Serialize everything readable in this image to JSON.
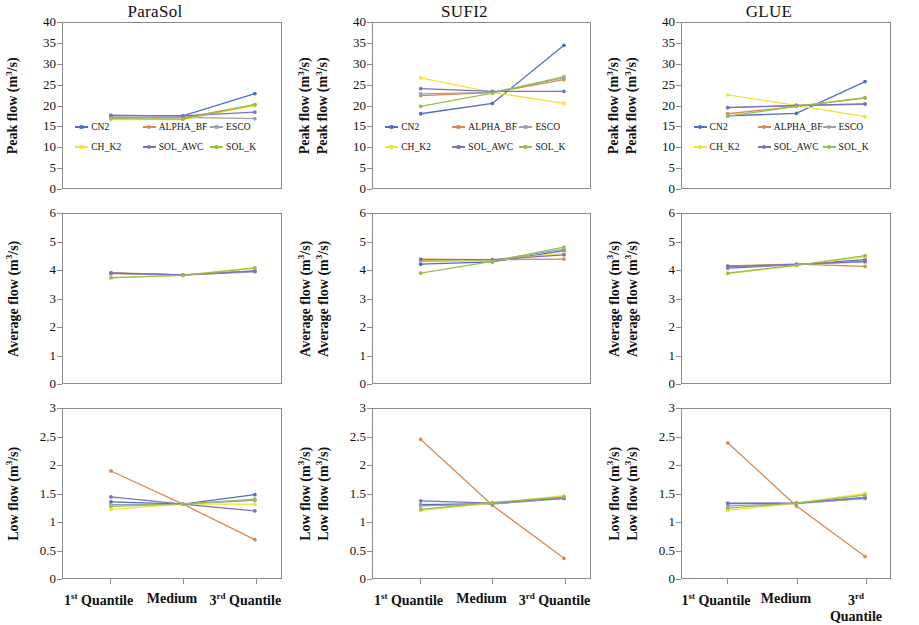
{
  "figure": {
    "columns": [
      "ParaSol",
      "SUFI2",
      "GLUE"
    ],
    "rows": [
      "Peak flow",
      "Average flow",
      "Low flow"
    ],
    "x_categories": [
      "1st Quantile",
      "Medium",
      "3rd Quantile"
    ],
    "x_categories_rich": [
      {
        "num": "1",
        "sup": "st",
        "word": "Quantile"
      },
      {
        "num": "",
        "sup": "",
        "word": "Medium"
      },
      {
        "num": "3",
        "sup": "rd",
        "word": "Quantile"
      }
    ],
    "axis_unit": "m³/s",
    "series_names": [
      "CN2",
      "ALPHA_BF",
      "ESCO",
      "CH_K2",
      "SOL_AWC",
      "SOL_K"
    ],
    "series_colors": {
      "CN2": "#4f6fc4",
      "ALPHA_BF": "#d98a4e",
      "ESCO": "#9aa3ad",
      "CH_K2": "#f2e23c",
      "SOL_AWC": "#7f6fc0",
      "SOL_K": "#96c04b"
    }
  },
  "legend": {
    "entries": [
      {
        "label": "CN2",
        "color": "#4f6fc4"
      },
      {
        "label": "ALPHA_BF",
        "color": "#d98a4e"
      },
      {
        "label": "ESCO",
        "color": "#9aa3ad"
      },
      {
        "label": "CH_K2",
        "color": "#f2e23c"
      },
      {
        "label": "SOL_AWC",
        "color": "#7f6fc0"
      },
      {
        "label": "SOL_K",
        "color": "#96c04b"
      }
    ]
  },
  "chart_data": [
    {
      "type": "line",
      "title": "ParaSol",
      "row": "Peak flow",
      "ylabel": "Peak flow (m³/s)",
      "xlabel": "",
      "categories": [
        "1st Quantile",
        "Medium",
        "3rd Quantile"
      ],
      "ylim": [
        0,
        40
      ],
      "yticks": [
        0,
        5,
        10,
        15,
        20,
        25,
        30,
        35,
        40
      ],
      "grid": false,
      "legend_position": "inside-lower-left",
      "series": [
        {
          "name": "CN2",
          "values": [
            17.6,
            17.5,
            22.9
          ]
        },
        {
          "name": "ALPHA_BF",
          "values": [
            17.1,
            17.0,
            20.2
          ]
        },
        {
          "name": "ESCO",
          "values": [
            17.2,
            17.1,
            16.8
          ]
        },
        {
          "name": "CH_K2",
          "values": [
            16.6,
            16.6,
            20.0
          ]
        },
        {
          "name": "SOL_AWC",
          "values": [
            17.6,
            17.5,
            18.4
          ]
        },
        {
          "name": "SOL_K",
          "values": [
            16.8,
            16.7,
            20.2
          ]
        }
      ]
    },
    {
      "type": "line",
      "title": "SUFI2",
      "row": "Peak flow",
      "ylabel": "Peak flow (m³/s)",
      "xlabel": "",
      "categories": [
        "1st Quantile",
        "Medium",
        "3rd Quantile"
      ],
      "ylim": [
        0,
        40
      ],
      "yticks": [
        0,
        5,
        10,
        15,
        20,
        25,
        30,
        35,
        40
      ],
      "grid": false,
      "legend_position": "inside-lower-left",
      "series": [
        {
          "name": "CN2",
          "values": [
            18.0,
            20.5,
            34.6
          ]
        },
        {
          "name": "ALPHA_BF",
          "values": [
            22.4,
            23.1,
            26.3
          ]
        },
        {
          "name": "ESCO",
          "values": [
            22.8,
            23.2,
            26.7
          ]
        },
        {
          "name": "CH_K2",
          "values": [
            26.7,
            23.2,
            20.5
          ]
        },
        {
          "name": "SOL_AWC",
          "values": [
            24.1,
            23.4,
            23.4
          ]
        },
        {
          "name": "SOL_K",
          "values": [
            19.8,
            23.0,
            27.0
          ]
        }
      ]
    },
    {
      "type": "line",
      "title": "GLUE",
      "row": "Peak flow",
      "ylabel": "Peak flow (m³/s)",
      "xlabel": "",
      "categories": [
        "1st Quantile",
        "Medium",
        "3rd Quantile"
      ],
      "ylim": [
        0,
        40
      ],
      "yticks": [
        0,
        5,
        10,
        15,
        20,
        25,
        30,
        35,
        40
      ],
      "grid": false,
      "legend_position": "inside-lower-left",
      "series": [
        {
          "name": "CN2",
          "values": [
            17.5,
            18.1,
            25.8
          ]
        },
        {
          "name": "ALPHA_BF",
          "values": [
            18.0,
            19.8,
            21.9
          ]
        },
        {
          "name": "ESCO",
          "values": [
            19.5,
            20.0,
            20.3
          ]
        },
        {
          "name": "CH_K2",
          "values": [
            22.6,
            20.0,
            17.3
          ]
        },
        {
          "name": "SOL_AWC",
          "values": [
            19.5,
            20.0,
            20.4
          ]
        },
        {
          "name": "SOL_K",
          "values": [
            17.4,
            19.8,
            21.8
          ]
        }
      ]
    },
    {
      "type": "line",
      "title": "ParaSol",
      "row": "Average flow",
      "ylabel": "Average flow (m³/s)",
      "xlabel": "",
      "categories": [
        "1st Quantile",
        "Medium",
        "3rd Quantile"
      ],
      "ylim": [
        0,
        6
      ],
      "yticks": [
        0,
        1,
        2,
        3,
        4,
        5,
        6
      ],
      "grid": false,
      "legend_position": "none",
      "series": [
        {
          "name": "CN2",
          "values": [
            3.9,
            3.84,
            3.98
          ]
        },
        {
          "name": "ALPHA_BF",
          "values": [
            3.92,
            3.84,
            3.96
          ]
        },
        {
          "name": "ESCO",
          "values": [
            3.88,
            3.83,
            3.95
          ]
        },
        {
          "name": "CH_K2",
          "values": [
            3.73,
            3.83,
            4.1
          ]
        },
        {
          "name": "SOL_AWC",
          "values": [
            3.9,
            3.84,
            3.97
          ]
        },
        {
          "name": "SOL_K",
          "values": [
            3.74,
            3.82,
            4.08
          ]
        }
      ]
    },
    {
      "type": "line",
      "title": "SUFI2",
      "row": "Average flow",
      "ylabel": "Average flow (m³/s)",
      "xlabel": "",
      "categories": [
        "1st Quantile",
        "Medium",
        "3rd Quantile"
      ],
      "ylim": [
        0,
        6
      ],
      "yticks": [
        0,
        1,
        2,
        3,
        4,
        5,
        6
      ],
      "grid": false,
      "legend_position": "none",
      "series": [
        {
          "name": "CN2",
          "values": [
            4.22,
            4.3,
            4.7
          ]
        },
        {
          "name": "ALPHA_BF",
          "values": [
            4.4,
            4.38,
            4.4
          ]
        },
        {
          "name": "ESCO",
          "values": [
            4.32,
            4.35,
            4.75
          ]
        },
        {
          "name": "CH_K2",
          "values": [
            4.35,
            4.36,
            4.6
          ]
        },
        {
          "name": "SOL_AWC",
          "values": [
            4.38,
            4.38,
            4.55
          ]
        },
        {
          "name": "SOL_K",
          "values": [
            3.9,
            4.32,
            4.82
          ]
        }
      ]
    },
    {
      "type": "line",
      "title": "GLUE",
      "row": "Average flow",
      "ylabel": "Average flow (m³/s)",
      "xlabel": "",
      "categories": [
        "1st Quantile",
        "Medium",
        "3rd Quantile"
      ],
      "ylim": [
        0,
        6
      ],
      "yticks": [
        0,
        1,
        2,
        3,
        4,
        5,
        6
      ],
      "grid": false,
      "legend_position": "none",
      "series": [
        {
          "name": "CN2",
          "values": [
            4.08,
            4.2,
            4.38
          ]
        },
        {
          "name": "ALPHA_BF",
          "values": [
            4.16,
            4.22,
            4.14
          ]
        },
        {
          "name": "ESCO",
          "values": [
            4.12,
            4.2,
            4.3
          ]
        },
        {
          "name": "CH_K2",
          "values": [
            3.88,
            4.18,
            4.48
          ]
        },
        {
          "name": "SOL_AWC",
          "values": [
            4.14,
            4.21,
            4.32
          ]
        },
        {
          "name": "SOL_K",
          "values": [
            3.9,
            4.18,
            4.52
          ]
        }
      ]
    },
    {
      "type": "line",
      "title": "ParaSol",
      "row": "Low flow",
      "ylabel": "Low flow (m³/s)",
      "xlabel": "",
      "categories": [
        "1st Quantile",
        "Medium",
        "3rd Quantile"
      ],
      "ylim": [
        0,
        3
      ],
      "yticks": [
        0,
        0.5,
        1,
        1.5,
        2,
        2.5,
        3
      ],
      "ytick_labels": [
        "0",
        "0.5",
        "1",
        "1.5",
        "2",
        "2.5",
        "3"
      ],
      "grid": false,
      "legend_position": "none",
      "series": [
        {
          "name": "CN2",
          "values": [
            1.35,
            1.31,
            1.48
          ]
        },
        {
          "name": "ALPHA_BF",
          "values": [
            1.9,
            1.31,
            0.68
          ]
        },
        {
          "name": "ESCO",
          "values": [
            1.3,
            1.31,
            1.38
          ]
        },
        {
          "name": "CH_K2",
          "values": [
            1.22,
            1.31,
            1.31
          ]
        },
        {
          "name": "SOL_AWC",
          "values": [
            1.44,
            1.31,
            1.19
          ]
        },
        {
          "name": "SOL_K",
          "values": [
            1.27,
            1.31,
            1.4
          ]
        }
      ]
    },
    {
      "type": "line",
      "title": "SUFI2",
      "row": "Low flow",
      "ylabel": "Low flow (m³/s)",
      "xlabel": "",
      "categories": [
        "1st Quantile",
        "Medium",
        "3rd Quantile"
      ],
      "ylim": [
        0,
        3
      ],
      "yticks": [
        0,
        0.5,
        1,
        1.5,
        2,
        2.5,
        3
      ],
      "ytick_labels": [
        "0",
        "0.5",
        "1",
        "1.5",
        "2",
        "2.5",
        "3"
      ],
      "grid": false,
      "legend_position": "none",
      "series": [
        {
          "name": "CN2",
          "values": [
            1.3,
            1.32,
            1.42
          ]
        },
        {
          "name": "ALPHA_BF",
          "values": [
            2.46,
            1.29,
            0.35
          ]
        },
        {
          "name": "ESCO",
          "values": [
            1.28,
            1.31,
            1.41
          ]
        },
        {
          "name": "CH_K2",
          "values": [
            1.2,
            1.33,
            1.46
          ]
        },
        {
          "name": "SOL_AWC",
          "values": [
            1.37,
            1.33,
            1.42
          ]
        },
        {
          "name": "SOL_K",
          "values": [
            1.22,
            1.34,
            1.44
          ]
        }
      ]
    },
    {
      "type": "line",
      "title": "GLUE",
      "row": "Low flow",
      "ylabel": "Low flow (m³/s)",
      "xlabel": "",
      "categories": [
        "1st Quantile",
        "Medium",
        "3rd Quantile"
      ],
      "ylim": [
        0,
        3
      ],
      "yticks": [
        0,
        0.5,
        1,
        1.5,
        2,
        2.5,
        3
      ],
      "ytick_labels": [
        "0",
        "0.5",
        "1",
        "1.5",
        "2",
        "2.5",
        "3"
      ],
      "grid": false,
      "legend_position": "none",
      "series": [
        {
          "name": "CN2",
          "values": [
            1.32,
            1.33,
            1.42
          ]
        },
        {
          "name": "ALPHA_BF",
          "values": [
            2.4,
            1.28,
            0.38
          ]
        },
        {
          "name": "ESCO",
          "values": [
            1.28,
            1.32,
            1.41
          ]
        },
        {
          "name": "CH_K2",
          "values": [
            1.2,
            1.33,
            1.5
          ]
        },
        {
          "name": "SOL_AWC",
          "values": [
            1.33,
            1.33,
            1.43
          ]
        },
        {
          "name": "SOL_K",
          "values": [
            1.24,
            1.33,
            1.47
          ]
        }
      ]
    }
  ]
}
